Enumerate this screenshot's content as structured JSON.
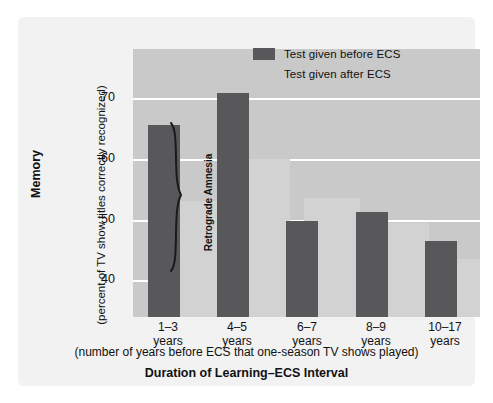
{
  "chart_data": {
    "type": "bar",
    "title": "",
    "categories": [
      "1–3\nyears",
      "4–5\nyears",
      "6–7\nyears",
      "8–9\nyears",
      "10–17\nyears"
    ],
    "category_labels": [
      {
        "range": "1–3",
        "unit": "years"
      },
      {
        "range": "4–5",
        "unit": "years"
      },
      {
        "range": "6–7",
        "unit": "years"
      },
      {
        "range": "8–9",
        "unit": "years"
      },
      {
        "range": "10–17",
        "unit": "years"
      }
    ],
    "series": [
      {
        "name": "Test given before ECS",
        "color": "#58585a",
        "values": [
          65.5,
          70.8,
          49.8,
          51.3,
          46.4
        ]
      },
      {
        "name": "Test given after ECS",
        "color": "#d2d2d2",
        "values": [
          53.0,
          60.0,
          53.5,
          49.5,
          43.5
        ]
      }
    ],
    "ylabel": "Memory",
    "ylabel_sub": "(percent of TV show titles correctly recognized)",
    "xlabel": "Duration of Learning–ECS Interval",
    "xlabel_sub": "(number of years before ECS that one-season TV shows played)",
    "ylim": [
      34.0,
      78.0
    ],
    "yticks": [
      40,
      50,
      60,
      70
    ],
    "ytick_labels": [
      "40",
      "50",
      "60",
      "70"
    ],
    "grid": true,
    "grid_color": "#ffffff",
    "legend_position": "top-right",
    "plot_background": "#c9c9c9",
    "panel_background": "#f2f2f2",
    "annotations": [
      {
        "text": "Retrograde Amnesia",
        "type": "brace-label",
        "orientation": "vertical",
        "spans_categories": [
          "1–3 years",
          "4–5 years"
        ]
      }
    ]
  },
  "legend": {
    "entries": [
      {
        "label": "Test given before ECS",
        "swatch": "dark"
      },
      {
        "label": "Test given after ECS",
        "swatch": "light"
      }
    ]
  },
  "axes": {
    "y": {
      "title": "Memory",
      "subtitle": "(percent of TV show titles correctly recognized)",
      "ticks": [
        "40",
        "50",
        "60",
        "70"
      ]
    },
    "x": {
      "title": "Duration of Learning–ECS Interval",
      "subtitle": "(number of years before ECS that one-season TV shows played)"
    }
  },
  "annotation": {
    "retrograde_amnesia": "Retrograde Amnesia"
  }
}
